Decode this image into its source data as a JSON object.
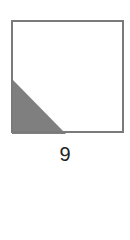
{
  "figure": {
    "label": "9",
    "square": {
      "x": 12,
      "y": 21,
      "size": 111,
      "stroke": "#7a7a7a",
      "stroke_width": 2
    },
    "shaded_region": {
      "shape": "triangle",
      "points": [
        [
          12,
          79
        ],
        [
          12,
          134
        ],
        [
          66,
          134
        ]
      ],
      "fill": "#7f7f7f"
    }
  }
}
